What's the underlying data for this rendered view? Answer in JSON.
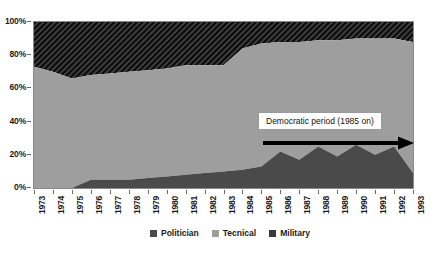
{
  "chart_data": {
    "type": "area",
    "stacked": true,
    "normalized": "100%",
    "title": "",
    "xlabel": "",
    "ylabel": "",
    "ylim": [
      0,
      100
    ],
    "ytick_labels": [
      "0%",
      "20%",
      "40%",
      "60%",
      "80%",
      "100%"
    ],
    "ytick_values": [
      0,
      20,
      40,
      60,
      80,
      100
    ],
    "grid": false,
    "legend_position": "bottom",
    "x": [
      1973,
      1974,
      1975,
      1976,
      1977,
      1978,
      1979,
      1980,
      1981,
      1982,
      1983,
      1984,
      1985,
      1986,
      1987,
      1988,
      1989,
      1990,
      1991,
      1992,
      1993
    ],
    "xtick_labels": [
      "1973",
      "1974",
      "1975",
      "1976",
      "1977",
      "1978",
      "1979",
      "1980",
      "1981",
      "1982",
      "1983",
      "1984",
      "1985",
      "1986",
      "1987",
      "1988",
      "1989",
      "1990",
      "1991",
      "1992",
      "1993"
    ],
    "series": [
      {
        "name": "Politician",
        "color": "#4a4a4a",
        "values": [
          0,
          0,
          0,
          5,
          5,
          5,
          6,
          7,
          8,
          9,
          10,
          11,
          13,
          22,
          17,
          25,
          19,
          26,
          20,
          25,
          9
        ]
      },
      {
        "name": "Tecnical",
        "color": "#9e9e9e",
        "values": [
          73,
          70,
          66,
          63,
          64,
          65,
          65,
          65,
          66,
          65,
          64,
          73,
          74,
          66,
          71,
          64,
          70,
          64,
          70,
          65,
          79
        ]
      },
      {
        "name": "Military",
        "color": "#3a3a3a",
        "pattern": "diagonal-hatch",
        "values": [
          27,
          30,
          34,
          32,
          31,
          30,
          29,
          28,
          26,
          26,
          26,
          16,
          13,
          12,
          12,
          11,
          11,
          10,
          10,
          10,
          12
        ]
      }
    ],
    "boundaries_note": "Lower boundary = Politician top; upper boundary = Politician+Tecnical top (Military fills remainder to 100%).",
    "annotation": {
      "text": "Democratic period (1985 on)",
      "arrow": "right"
    }
  },
  "legend": {
    "items": [
      {
        "label": "Politician"
      },
      {
        "label": "Tecnical"
      },
      {
        "label": "Military"
      }
    ]
  }
}
